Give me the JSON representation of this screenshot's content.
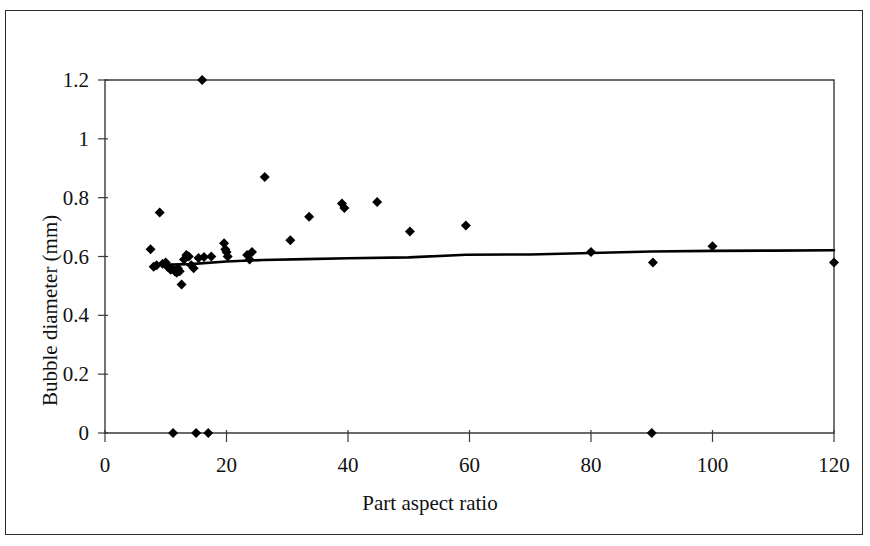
{
  "chart_data": {
    "type": "scatter",
    "title": "",
    "xlabel": "Part aspect ratio",
    "ylabel": "Bubble diameter (mm)",
    "xlim": [
      0,
      120
    ],
    "ylim": [
      0,
      1.2
    ],
    "xticks": [
      0,
      20,
      40,
      60,
      80,
      100,
      120
    ],
    "yticks": [
      0,
      0.2,
      0.4,
      0.6,
      0.8,
      1,
      1.2
    ],
    "xtick_labels": [
      "0",
      "20",
      "40",
      "60",
      "80",
      "100",
      "120"
    ],
    "ytick_labels": [
      "0",
      "0.2",
      "0.4",
      "0.6",
      "0.8",
      "1",
      "1.2"
    ],
    "grid": false,
    "legend": null,
    "marker": "diamond",
    "marker_color": "#000000",
    "series": [
      {
        "name": "Bubble diameter measurements",
        "type": "scatter",
        "points": [
          [
            7.5,
            0.625
          ],
          [
            8.0,
            0.565
          ],
          [
            8.5,
            0.57
          ],
          [
            9.0,
            0.75
          ],
          [
            9.5,
            0.575
          ],
          [
            10.0,
            0.58
          ],
          [
            10.3,
            0.565
          ],
          [
            10.8,
            0.555
          ],
          [
            11.0,
            0.56
          ],
          [
            11.2,
            0.0
          ],
          [
            11.5,
            0.55
          ],
          [
            11.8,
            0.545
          ],
          [
            12.0,
            0.56
          ],
          [
            12.3,
            0.55
          ],
          [
            12.6,
            0.505
          ],
          [
            13.0,
            0.59
          ],
          [
            13.4,
            0.605
          ],
          [
            13.8,
            0.6
          ],
          [
            14.2,
            0.57
          ],
          [
            14.6,
            0.56
          ],
          [
            15.0,
            0.0
          ],
          [
            15.4,
            0.595
          ],
          [
            16.0,
            1.2
          ],
          [
            16.3,
            0.598
          ],
          [
            17.0,
            0.0
          ],
          [
            17.5,
            0.6
          ],
          [
            19.6,
            0.645
          ],
          [
            19.8,
            0.625
          ],
          [
            20.0,
            0.615
          ],
          [
            20.2,
            0.6
          ],
          [
            23.4,
            0.605
          ],
          [
            23.8,
            0.59
          ],
          [
            24.2,
            0.615
          ],
          [
            26.3,
            0.87
          ],
          [
            30.5,
            0.655
          ],
          [
            33.6,
            0.735
          ],
          [
            39.0,
            0.78
          ],
          [
            39.4,
            0.765
          ],
          [
            44.8,
            0.785
          ],
          [
            50.2,
            0.685
          ],
          [
            59.4,
            0.705
          ],
          [
            80.0,
            0.615
          ],
          [
            90.0,
            0.0
          ],
          [
            90.2,
            0.58
          ],
          [
            100.0,
            0.635
          ],
          [
            120.0,
            0.58
          ]
        ]
      },
      {
        "name": "Trend line",
        "type": "line",
        "color": "#000000",
        "points": [
          [
            9.5,
            0.572
          ],
          [
            14.0,
            0.574
          ],
          [
            20.0,
            0.583
          ],
          [
            26.0,
            0.588
          ],
          [
            33.0,
            0.591
          ],
          [
            40.0,
            0.594
          ],
          [
            50.0,
            0.597
          ],
          [
            59.4,
            0.606
          ],
          [
            70.0,
            0.607
          ],
          [
            80.0,
            0.612
          ],
          [
            90.0,
            0.617
          ],
          [
            100.0,
            0.619
          ],
          [
            110.0,
            0.62
          ],
          [
            120.0,
            0.621
          ]
        ]
      }
    ]
  }
}
